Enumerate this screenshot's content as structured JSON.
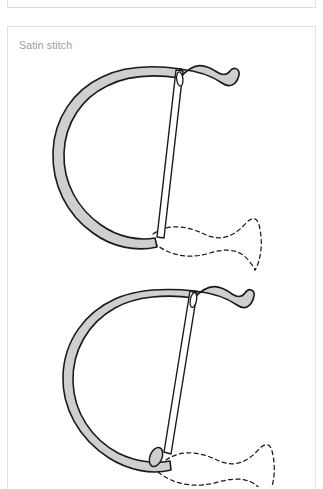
{
  "page": {
    "background_color": "#ffffff"
  },
  "card": {
    "title": "Satin stitch",
    "title_color": "#9b9b9b",
    "border_color": "#e2e2e2",
    "background_color": "#ffffff"
  },
  "illustration": {
    "name": "satin-stitch-diagram",
    "description": "Two step-by-step embroidery diagrams showing a threaded needle passing through a looped thread over a dashed fabric ribbon",
    "colors": {
      "thread_fill": "#cfcfcf",
      "thread_outline": "#1a1a1a",
      "needle_fill": "#ffffff",
      "needle_outline": "#1a1a1a",
      "fabric_dash": "#1a1a1a"
    },
    "steps": [
      {
        "label": "step-1",
        "needle_angle_deg": 8,
        "has_loose_thread_end": false
      },
      {
        "label": "step-2",
        "needle_angle_deg": 18,
        "has_loose_thread_end": true
      }
    ]
  }
}
